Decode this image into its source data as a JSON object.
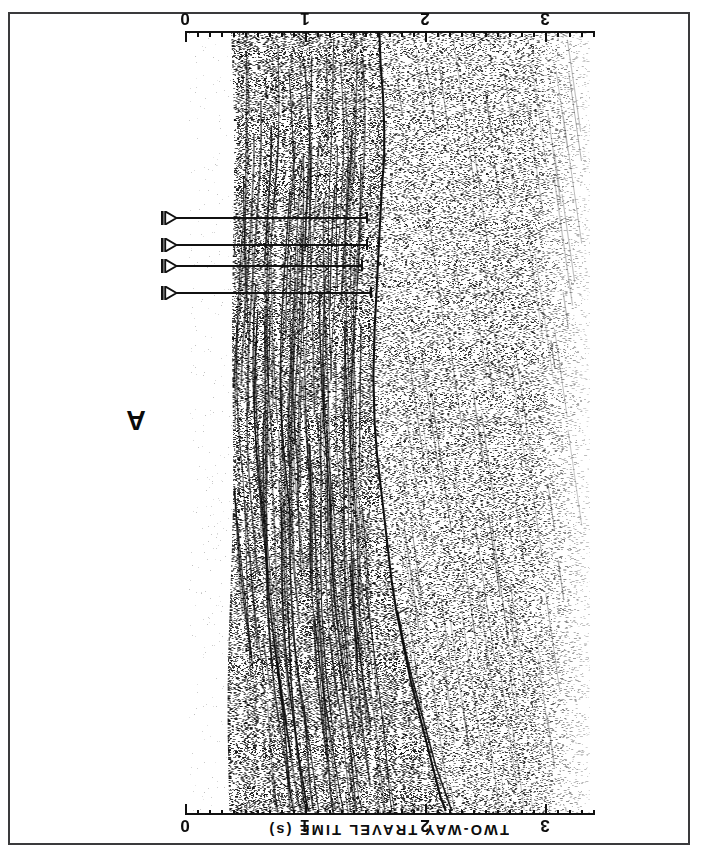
{
  "figure": {
    "kind": "seismic-reflection-profile",
    "panel_letter": "A",
    "background_color": "#ffffff",
    "ink_color": "#111111",
    "border_color": "#3a3a3c",
    "orientation_note": "rotated-180"
  },
  "axis": {
    "title": "TWO-WAY TRAVEL TIME (s)",
    "unit": "s",
    "tick_labels": [
      "0",
      "1",
      "2",
      "3"
    ],
    "tick_values": [
      0,
      1,
      2,
      3
    ],
    "minor_tick_interval": 0.1,
    "range": [
      0,
      3.4
    ],
    "pixels_per_second": 120,
    "origin_px": 185
  },
  "annotations": {
    "arrow_count": 4,
    "arrows": [
      {
        "label": "arrow-1",
        "time_s": 1.52,
        "y_px": 218,
        "length_px": 192
      },
      {
        "label": "arrow-2",
        "time_s": 1.52,
        "y_px": 245,
        "length_px": 192
      },
      {
        "label": "arrow-3",
        "time_s": 1.48,
        "y_px": 266,
        "length_px": 187
      },
      {
        "label": "arrow-4",
        "time_s": 1.55,
        "y_px": 293,
        "length_px": 196
      }
    ]
  },
  "chart_data": {
    "type": "line",
    "xlabel": "TWO-WAY TRAVEL TIME (s)",
    "ylabel": "",
    "xlim": [
      0,
      3.4
    ],
    "grid": false,
    "legend": "none",
    "annotations": [
      "A"
    ],
    "series": [
      {
        "name": "interpreted-horizon",
        "comment": "Dark interpreted reflector traced across the section; x = two-way travel time (s), y = distance along profile (0 = top of panel, 1 = bottom).",
        "x": [
          1.62,
          1.63,
          1.65,
          1.66,
          1.66,
          1.64,
          1.62,
          1.6,
          1.58,
          1.57,
          1.58,
          1.6,
          1.63,
          1.66,
          1.69,
          1.72,
          1.76,
          1.8,
          1.84,
          1.88,
          1.93,
          1.98,
          2.03,
          2.08,
          2.13,
          2.18
        ],
        "y": [
          0.0,
          0.04,
          0.08,
          0.12,
          0.16,
          0.2,
          0.26,
          0.32,
          0.38,
          0.44,
          0.5,
          0.54,
          0.58,
          0.62,
          0.66,
          0.7,
          0.74,
          0.77,
          0.8,
          0.83,
          0.86,
          0.89,
          0.92,
          0.95,
          0.98,
          1.0
        ]
      },
      {
        "name": "secondary-horizon-branch",
        "comment": "Lower branch splitting off the main horizon in the bottom third of the panel.",
        "x": [
          1.77,
          1.82,
          1.88,
          1.95,
          2.02,
          2.09,
          2.16,
          2.23
        ],
        "y": [
          0.74,
          0.78,
          0.82,
          0.86,
          0.9,
          0.94,
          0.97,
          1.0
        ]
      }
    ],
    "facies": [
      {
        "name": "layered-sediment-wedge",
        "time_range_s": [
          0.4,
          1.6
        ],
        "texture": "sub-parallel banded reflectors"
      },
      {
        "name": "chaotic-basement",
        "time_range_s": [
          1.6,
          3.4
        ],
        "texture": "speckled incoherent scatter"
      },
      {
        "name": "water-column-mute",
        "time_range_s": [
          0.0,
          0.4
        ],
        "texture": "blank"
      }
    ]
  }
}
